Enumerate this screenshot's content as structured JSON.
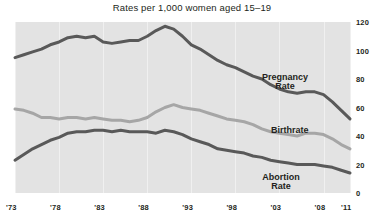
{
  "chart_data": {
    "type": "line",
    "title": "Rates per 1,000 women aged 15–19",
    "xlabel": "",
    "ylabel": "",
    "ylim": [
      0,
      120
    ],
    "yticks": [
      0,
      20,
      40,
      60,
      80,
      100,
      120
    ],
    "xlim": [
      1973,
      2011
    ],
    "xticks": [
      1973,
      1978,
      1983,
      1988,
      1993,
      1998,
      2003,
      2008,
      2011
    ],
    "xticklabels": [
      "'73",
      "'78",
      "'83",
      "'88",
      "'93",
      "'98",
      "'03",
      "'08",
      "'11"
    ],
    "grid": "vertical-only",
    "legend": "inline-annotations",
    "plot_background": "#e3e3e3",
    "x": [
      1973,
      1974,
      1975,
      1976,
      1977,
      1978,
      1979,
      1980,
      1981,
      1982,
      1983,
      1984,
      1985,
      1986,
      1987,
      1988,
      1989,
      1990,
      1991,
      1992,
      1993,
      1994,
      1995,
      1996,
      1997,
      1998,
      1999,
      2000,
      2001,
      2002,
      2003,
      2004,
      2005,
      2006,
      2007,
      2008,
      2009,
      2010,
      2011
    ],
    "series": [
      {
        "name": "Pregnancy Rate",
        "color": "#595959",
        "values": [
          95,
          97,
          99,
          101,
          104,
          106,
          109,
          110,
          109,
          110,
          106,
          105,
          106,
          107,
          107,
          110,
          114,
          117,
          115,
          110,
          104,
          101,
          97,
          93,
          90,
          88,
          85,
          82,
          80,
          76,
          73,
          71,
          70,
          71,
          71,
          69,
          64,
          58,
          52
        ]
      },
      {
        "name": "Birthrate",
        "color": "#a6a6a6",
        "values": [
          59,
          58,
          56,
          53,
          53,
          52,
          53,
          53,
          52,
          53,
          52,
          51,
          51,
          50,
          51,
          53,
          57,
          60,
          62,
          60,
          59,
          58,
          56,
          54,
          52,
          51,
          50,
          48,
          45,
          43,
          42,
          41,
          40,
          42,
          42,
          41,
          38,
          34,
          31
        ]
      },
      {
        "name": "Abortion Rate",
        "color": "#595959",
        "values": [
          23,
          27,
          31,
          34,
          37,
          39,
          42,
          43,
          43,
          44,
          44,
          43,
          44,
          43,
          43,
          43,
          42,
          44,
          43,
          41,
          38,
          36,
          34,
          31,
          30,
          29,
          28,
          26,
          25,
          23,
          22,
          21,
          20,
          20,
          20,
          19,
          18,
          16,
          14
        ]
      }
    ],
    "annotations": [
      {
        "name": "Pregnancy Rate",
        "text": "Pregnancy\nRate"
      },
      {
        "name": "Birthrate",
        "text": "Birthrate"
      },
      {
        "name": "Abortion Rate",
        "text": "Abortion\nRate"
      }
    ]
  },
  "axes": {
    "ytick_labels": [
      "120",
      "100",
      "80",
      "60",
      "40",
      "20",
      "0"
    ],
    "xtick_labels": [
      "'73",
      "'78",
      "'83",
      "'88",
      "'93",
      "'98",
      "'03",
      "'08",
      "'11"
    ]
  },
  "labels": {
    "pregnancy": "Pregnancy\nRate",
    "birthrate": "Birthrate",
    "abortion": "Abortion\nRate"
  }
}
